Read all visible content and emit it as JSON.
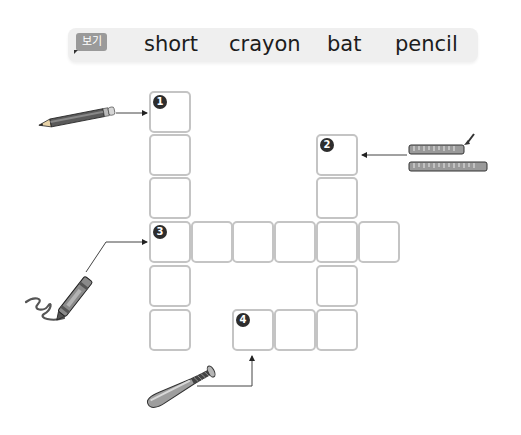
{
  "word_bank": {
    "label": "보기",
    "words": [
      "short",
      "crayon",
      "bat",
      "pencil"
    ]
  },
  "clues": [
    {
      "number": "1",
      "picture": "pencil-icon",
      "direction": "down",
      "length": 6
    },
    {
      "number": "2",
      "picture": "short-ruler-icon",
      "direction": "down",
      "length": 5
    },
    {
      "number": "3",
      "picture": "crayon-icon",
      "direction": "across",
      "length": 6
    },
    {
      "number": "4",
      "picture": "bat-icon",
      "direction": "across",
      "length": 3
    }
  ],
  "colors": {
    "banner_bg": "#efefef",
    "label_bg": "#9a9a9a",
    "cell_border": "#c4c4c4",
    "number_bg": "#2d2d2d"
  }
}
